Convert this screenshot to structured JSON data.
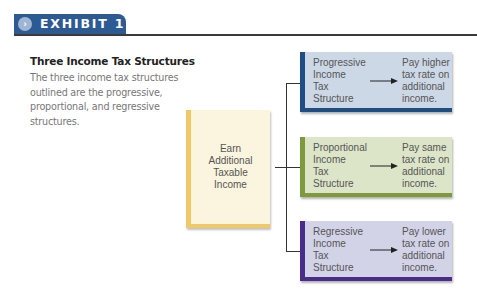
{
  "header": {
    "label": "EXHIBIT 1",
    "icon": "chevron-right-icon",
    "tab_color": "#2e5a94"
  },
  "figure": {
    "title": "Three Income Tax Structures",
    "description": "The three income tax structures outlined are the progressive, proportional, and regressive structures."
  },
  "source_node": {
    "text": "Earn\nAdditional\nTaxable\nIncome",
    "fill": "#fbf4df",
    "accent": "#f0c868"
  },
  "structures": [
    {
      "name": "Progressive\nIncome\nTax\nStructure",
      "result": "Pay higher\ntax rate on\nadditional\nincome.",
      "fill": "#cdd8e6",
      "accent": "#1f4f82"
    },
    {
      "name": "Proportional\nIncome\nTax\nStructure",
      "result": "Pay same\ntax rate on\nadditional\nincome.",
      "fill": "#dde5c9",
      "accent": "#7f9a3c"
    },
    {
      "name": "Regressive\nIncome\nTax\nStructure",
      "result": "Pay lower\ntax rate on\nadditional\nincome.",
      "fill": "#d3d3e8",
      "accent": "#4a2d8a"
    }
  ]
}
